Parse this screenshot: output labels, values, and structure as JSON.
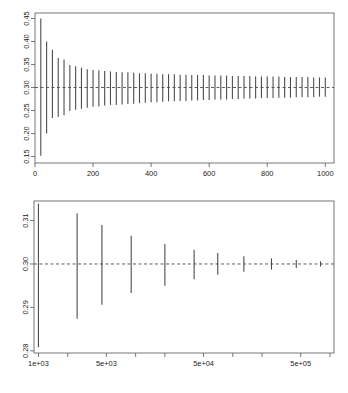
{
  "figure": {
    "title": "",
    "background": "#ffffff",
    "line_color": "#4d4d4d",
    "axis_color": "#555555",
    "reference_color": "#333333",
    "panel_count": 2
  },
  "chart_data": [
    {
      "type": "line",
      "id": "panel-top",
      "title": "",
      "xlabel": "",
      "ylabel": "",
      "xscale": "linear",
      "yscale": "linear",
      "xlim": [
        0,
        1030
      ],
      "ylim": [
        0.136,
        0.462
      ],
      "grid": false,
      "legend": null,
      "xticks": [
        0,
        200,
        400,
        600,
        800,
        1000
      ],
      "xticklabels": [
        "0",
        "200",
        "400",
        "600",
        "800",
        "1000"
      ],
      "yticks": [
        0.15,
        0.2,
        0.25,
        0.3,
        0.35,
        0.4,
        0.45
      ],
      "yticklabels": [
        "0.15",
        "0.20",
        "0.25",
        "0.30",
        "0.35",
        "0.40",
        "0.45"
      ],
      "reference_line": {
        "y": 0.3,
        "style": "dashed",
        "label": "0.30"
      },
      "series": [
        {
          "name": "confidence-interval-segments",
          "marker": "vertical-segment",
          "x": [
            20,
            40,
            60,
            80,
            100,
            120,
            140,
            160,
            180,
            200,
            220,
            240,
            260,
            280,
            300,
            320,
            340,
            360,
            380,
            400,
            420,
            440,
            460,
            480,
            500,
            520,
            540,
            560,
            580,
            600,
            620,
            640,
            660,
            680,
            700,
            720,
            740,
            760,
            780,
            800,
            820,
            840,
            860,
            880,
            900,
            920,
            940,
            960,
            980,
            1000
          ],
          "ylow": [
            0.152,
            0.2,
            0.234,
            0.236,
            0.24,
            0.249,
            0.252,
            0.254,
            0.256,
            0.258,
            0.259,
            0.261,
            0.262,
            0.262,
            0.263,
            0.264,
            0.265,
            0.266,
            0.267,
            0.268,
            0.268,
            0.269,
            0.27,
            0.27,
            0.271,
            0.271,
            0.272,
            0.272,
            0.273,
            0.273,
            0.274,
            0.274,
            0.274,
            0.275,
            0.275,
            0.276,
            0.276,
            0.276,
            0.277,
            0.277,
            0.277,
            0.278,
            0.278,
            0.278,
            0.279,
            0.279,
            0.279,
            0.279,
            0.28,
            0.28
          ],
          "yhigh": [
            0.45,
            0.4,
            0.382,
            0.364,
            0.361,
            0.349,
            0.346,
            0.343,
            0.34,
            0.338,
            0.337,
            0.336,
            0.335,
            0.334,
            0.333,
            0.333,
            0.332,
            0.331,
            0.331,
            0.33,
            0.33,
            0.329,
            0.329,
            0.329,
            0.328,
            0.328,
            0.327,
            0.327,
            0.327,
            0.326,
            0.326,
            0.326,
            0.326,
            0.325,
            0.325,
            0.325,
            0.325,
            0.324,
            0.324,
            0.324,
            0.324,
            0.324,
            0.323,
            0.323,
            0.323,
            0.323,
            0.323,
            0.322,
            0.322,
            0.322
          ]
        }
      ]
    },
    {
      "type": "line",
      "id": "panel-bottom",
      "title": "",
      "xlabel": "",
      "ylabel": "",
      "xscale": "log",
      "yscale": "linear",
      "xlim": [
        900,
        1100000
      ],
      "ylim": [
        0.2795,
        0.3145
      ],
      "grid": false,
      "legend": null,
      "xticks": [
        1000,
        5000,
        50000,
        500000
      ],
      "xticklabels": [
        "1e+03",
        "5e+03",
        "5e+04",
        "5e+05"
      ],
      "xminorticks": [
        2000,
        10000,
        20000,
        100000,
        200000,
        1000000
      ],
      "yticks": [
        0.28,
        0.29,
        0.3,
        0.31
      ],
      "yticklabels": [
        "0.28",
        "0.29",
        "0.30",
        "0.31"
      ],
      "reference_line": {
        "y": 0.3,
        "style": "dashed",
        "label": "0.30"
      },
      "series": [
        {
          "name": "confidence-interval-segments",
          "marker": "vertical-segment",
          "x": [
            1000,
            2500,
            4500,
            9000,
            20000,
            40000,
            70000,
            130000,
            250000,
            450000,
            800000
          ],
          "ylow": [
            0.2808,
            0.2874,
            0.2906,
            0.2933,
            0.295,
            0.2965,
            0.2975,
            0.2982,
            0.2987,
            0.2991,
            0.2994
          ],
          "yhigh": [
            0.3139,
            0.3117,
            0.309,
            0.3065,
            0.3046,
            0.3033,
            0.3025,
            0.3018,
            0.3013,
            0.3009,
            0.3006
          ]
        }
      ]
    }
  ]
}
